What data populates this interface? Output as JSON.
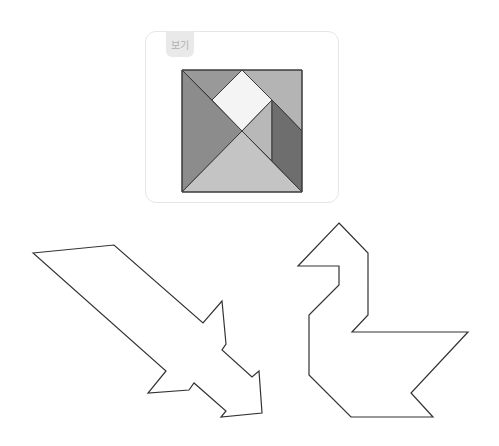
{
  "example_card": {
    "label": "보기",
    "tangram_square": {
      "pieces": [
        {
          "name": "left-large-triangle",
          "color": "#8c8c8c"
        },
        {
          "name": "bottom-large-triangle",
          "color": "#c4c4c4"
        },
        {
          "name": "top-left-medium-triangle",
          "color": "#999999"
        },
        {
          "name": "center-square",
          "color": "#f4f4f4"
        },
        {
          "name": "top-right-trapezoid",
          "color": "#b4b4b4"
        },
        {
          "name": "small-triangle",
          "color": "#b8b8b8"
        },
        {
          "name": "parallelogram",
          "color": "#6e6e6e"
        }
      ]
    }
  },
  "puzzles": [
    {
      "name": "arrow-sword-outline"
    },
    {
      "name": "swan-outline"
    }
  ],
  "colors": {
    "outline": "#333333",
    "edge": "#3a3a3a"
  }
}
